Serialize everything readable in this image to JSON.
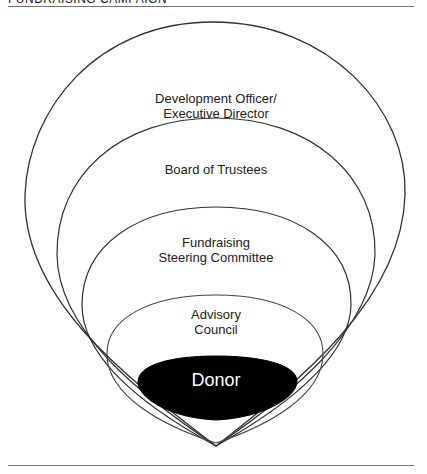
{
  "header": {
    "title": "FUNDRAISING CAMPAIGN"
  },
  "diagram": {
    "type": "nested-circles",
    "layers": [
      {
        "id": "outer",
        "label_line1": "Development Officer/",
        "label_line2": "Executive Director"
      },
      {
        "id": "board",
        "label_line1": "Board of Trustees"
      },
      {
        "id": "steering",
        "label_line1": "Fundraising",
        "label_line2": "Steering Committee"
      },
      {
        "id": "advisory",
        "label_line1": "Advisory",
        "label_line2": "Council"
      },
      {
        "id": "donor",
        "label_line1": "Donor",
        "fill": "#000000",
        "text_color": "#ffffff"
      }
    ],
    "stroke_color": "#333333"
  }
}
